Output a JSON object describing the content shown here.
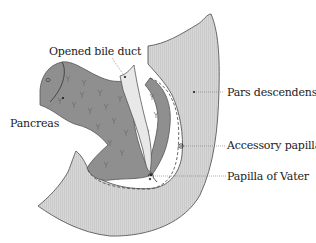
{
  "diagram": {
    "labels": {
      "bile_duct": "Opened bile duct",
      "pancreas": "Pancreas",
      "pars_descendens": "Pars descendens",
      "accessory_papilla": "Accessory papilla",
      "papilla_of_vater": "Papilla of Vater"
    },
    "colors": {
      "duodenum_fill": "#d4d4d4",
      "pancreas_fill": "#8f8f8f",
      "bile_duct_fill": "#e6e6e6",
      "outline": "#555555",
      "leader": "#777777",
      "text": "#222222"
    }
  }
}
